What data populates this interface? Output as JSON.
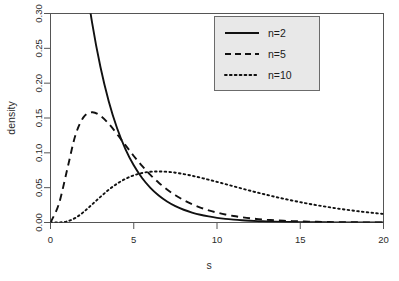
{
  "chart_data": {
    "type": "line",
    "title": "",
    "xlabel": "s",
    "ylabel": "density",
    "xlim": [
      0,
      20
    ],
    "ylim": [
      0,
      0.3
    ],
    "grid": false,
    "legend_position": "top-right",
    "xticks": [
      "0",
      "5",
      "10",
      "15",
      "20"
    ],
    "xtick_values": [
      0,
      5,
      10,
      15,
      20
    ],
    "yticks": [
      "0.00",
      "0.05",
      "0.10",
      "0.15",
      "0.20",
      "0.25",
      "0.30"
    ],
    "ytick_values": [
      0.0,
      0.05,
      0.1,
      0.15,
      0.2,
      0.25,
      0.3
    ],
    "x": [
      0,
      0.5,
      1,
      1.5,
      2,
      2.5,
      3,
      3.5,
      4,
      4.5,
      5,
      5.5,
      6,
      6.5,
      7,
      7.5,
      8,
      8.5,
      9,
      9.5,
      10,
      10.5,
      11,
      11.5,
      12,
      12.5,
      13,
      13.5,
      14,
      14.5,
      15,
      15.5,
      16,
      16.5,
      17,
      17.5,
      18,
      18.5,
      19,
      19.5,
      20
    ],
    "series": [
      {
        "name": "n=2",
        "label": "n=2",
        "style": "solid",
        "color": "#111111",
        "values": [
          1.0,
          0.7788,
          0.6065,
          0.4724,
          0.3679,
          0.2865,
          0.2231,
          0.1738,
          0.1353,
          0.1054,
          0.0821,
          0.0639,
          0.0498,
          0.0388,
          0.0302,
          0.0235,
          0.0183,
          0.0143,
          0.0111,
          0.0087,
          0.0067,
          0.0052,
          0.0041,
          0.0032,
          0.0025,
          0.0019,
          0.0015,
          0.0012,
          0.0009,
          0.0007,
          0.0006,
          0.0004,
          0.0003,
          0.0003,
          0.0002,
          0.0002,
          0.0001,
          0.0001,
          0.0001,
          0.0001,
          0.0001
        ]
      },
      {
        "name": "n=5",
        "label": "n=5",
        "style": "dashed",
        "color": "#111111",
        "values": [
          0.0,
          0.0264,
          0.0758,
          0.1255,
          0.1516,
          0.1583,
          0.1533,
          0.1417,
          0.1268,
          0.111,
          0.0955,
          0.0812,
          0.0684,
          0.0571,
          0.0474,
          0.0391,
          0.0321,
          0.0263,
          0.0215,
          0.0175,
          0.0142,
          0.0115,
          0.0093,
          0.0075,
          0.006,
          0.0048,
          0.0039,
          0.0031,
          0.0025,
          0.002,
          0.0016,
          0.0013,
          0.001,
          0.0008,
          0.0006,
          0.0005,
          0.0004,
          0.0003,
          0.0002,
          0.0002,
          0.0002
        ]
      },
      {
        "name": "n=10",
        "label": "n=10",
        "style": "dotted",
        "color": "#111111",
        "values": [
          0.0,
          0.0001,
          0.0016,
          0.0067,
          0.0153,
          0.0259,
          0.0368,
          0.047,
          0.0557,
          0.0626,
          0.0677,
          0.071,
          0.0728,
          0.0733,
          0.0728,
          0.0715,
          0.0695,
          0.0671,
          0.0644,
          0.0614,
          0.0583,
          0.0551,
          0.0519,
          0.0487,
          0.0456,
          0.0425,
          0.0396,
          0.0368,
          0.0341,
          0.0316,
          0.0292,
          0.0269,
          0.0248,
          0.0228,
          0.0209,
          0.0192,
          0.0176,
          0.0161,
          0.0147,
          0.0135,
          0.0123
        ]
      }
    ],
    "annotations": []
  },
  "legend": {
    "entries": [
      {
        "label": "n=2",
        "style": "solid"
      },
      {
        "label": "n=5",
        "style": "dashed"
      },
      {
        "label": "n=10",
        "style": "dotted"
      }
    ]
  },
  "axes": {
    "x_title": "s",
    "y_title": "density"
  }
}
